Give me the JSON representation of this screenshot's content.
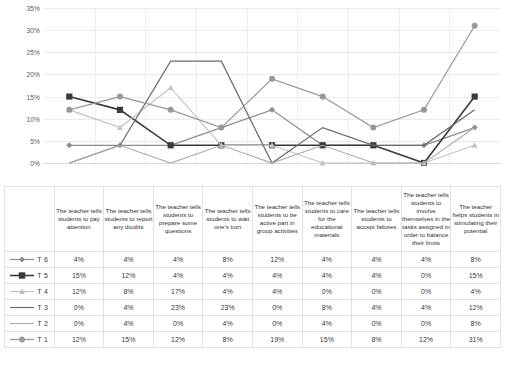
{
  "chart_data": {
    "type": "line",
    "title": "",
    "xlabel": "",
    "ylabel": "",
    "ylim": [
      0,
      35
    ],
    "grid": true,
    "legend_position": "table-left",
    "ytick_labels": [
      "35%",
      "30%",
      "25%",
      "20%",
      "15%",
      "10%",
      "5%",
      "0%"
    ],
    "ytick_values": [
      35,
      30,
      25,
      20,
      15,
      10,
      5,
      0
    ],
    "categories": [
      "The teacher tells students to pay attention",
      "The teacher tells students to report any doubts",
      "The teacher tells students to prepare some questions",
      "The teacher tells students to wait one's turn",
      "The teacher tells students to be active part in group activities",
      "The teacher tells students to care for the educational materials",
      "The teacher tells students to accept failures",
      "The teacher tells students to involve themselves in the tasks assigned in order to balance their limits",
      "The teacher helps students in stimulating their potential"
    ],
    "series": [
      {
        "name": "T 6",
        "marker": "diamond",
        "color": "#8c8c8c",
        "values": [
          4,
          4,
          4,
          8,
          12,
          4,
          4,
          4,
          8
        ],
        "labels": [
          "4%",
          "4%",
          "4%",
          "8%",
          "12%",
          "4%",
          "4%",
          "4%",
          "8%"
        ]
      },
      {
        "name": "T 5",
        "marker": "square",
        "color": "#3a3a3a",
        "values": [
          15,
          12,
          4,
          4,
          4,
          4,
          4,
          0,
          15
        ],
        "labels": [
          "15%",
          "12%",
          "4%",
          "4%",
          "4%",
          "4%",
          "4%",
          "0%",
          "15%"
        ]
      },
      {
        "name": "T 4",
        "marker": "triangle",
        "color": "#c2c2c2",
        "values": [
          12,
          8,
          17,
          4,
          4,
          0,
          0,
          0,
          4
        ],
        "labels": [
          "12%",
          "8%",
          "17%",
          "4%",
          "4%",
          "0%",
          "0%",
          "0%",
          "4%"
        ]
      },
      {
        "name": "T 3",
        "marker": "none",
        "color": "#6b6b6b",
        "values": [
          0,
          4,
          23,
          23,
          0,
          8,
          4,
          4,
          12
        ],
        "labels": [
          "0%",
          "4%",
          "23%",
          "23%",
          "0%",
          "8%",
          "4%",
          "4%",
          "12%"
        ]
      },
      {
        "name": "T 2",
        "marker": "none",
        "color": "#aeaeae",
        "values": [
          0,
          4,
          0,
          4,
          0,
          4,
          0,
          0,
          8
        ],
        "labels": [
          "0%",
          "4%",
          "0%",
          "4%",
          "0%",
          "4%",
          "0%",
          "0%",
          "8%"
        ]
      },
      {
        "name": "T 1",
        "marker": "circle",
        "color": "#989898",
        "values": [
          12,
          15,
          12,
          8,
          19,
          15,
          8,
          12,
          31
        ],
        "labels": [
          "12%",
          "15%",
          "12%",
          "8%",
          "19%",
          "15%",
          "8%",
          "12%",
          "31%"
        ]
      }
    ]
  }
}
